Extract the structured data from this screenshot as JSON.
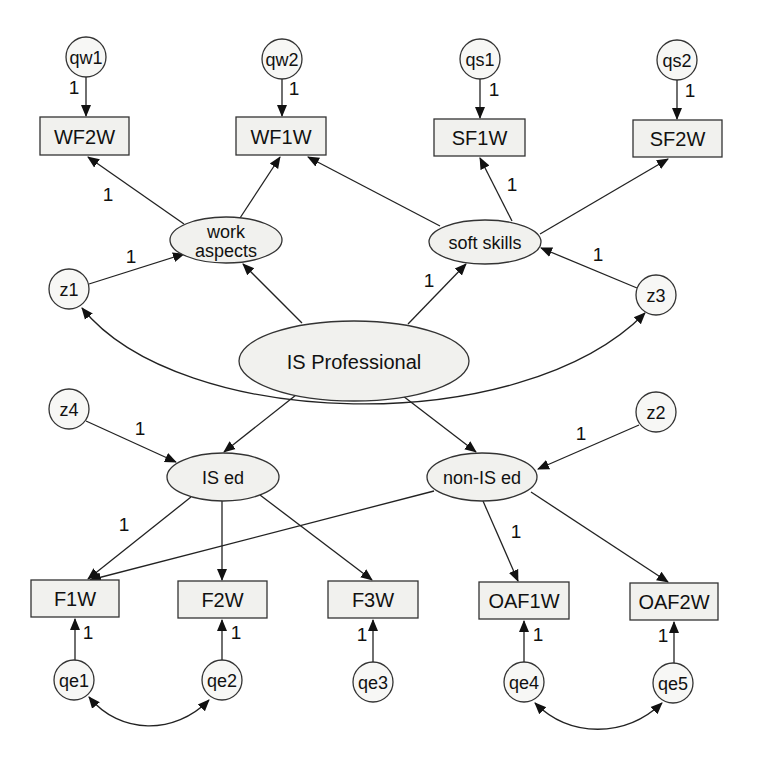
{
  "diagram": {
    "type": "structural-equation-model",
    "colors": {
      "node_fill": "#f1f1ee",
      "stroke": "#333333",
      "text": "#111111",
      "background": "#ffffff"
    },
    "latent_central": {
      "id": "is_professional",
      "label": "IS Professional"
    },
    "latent_factors": [
      {
        "id": "work_aspects",
        "label_line1": "work",
        "label_line2": "aspects"
      },
      {
        "id": "soft_skills",
        "label": "soft skills"
      },
      {
        "id": "is_ed",
        "label": "IS ed"
      },
      {
        "id": "non_is_ed",
        "label": "non-IS ed"
      }
    ],
    "observed_top": [
      {
        "id": "WF2W",
        "label": "WF2W",
        "error": "qw1",
        "error_weight": "1"
      },
      {
        "id": "WF1W",
        "label": "WF1W",
        "error": "qw2",
        "error_weight": "1"
      },
      {
        "id": "SF1W",
        "label": "SF1W",
        "error": "qs1",
        "error_weight": "1"
      },
      {
        "id": "SF2W",
        "label": "SF2W",
        "error": "qs2",
        "error_weight": "1"
      }
    ],
    "observed_bottom": [
      {
        "id": "F1W",
        "label": "F1W",
        "error": "qe1",
        "error_weight": "1"
      },
      {
        "id": "F2W",
        "label": "F2W",
        "error": "qe2",
        "error_weight": "1"
      },
      {
        "id": "F3W",
        "label": "F3W",
        "error": "qe3",
        "error_weight": "1"
      },
      {
        "id": "OAF1W",
        "label": "OAF1W",
        "error": "qe4",
        "error_weight": "1"
      },
      {
        "id": "OAF2W",
        "label": "OAF2W",
        "error": "qe5",
        "error_weight": "1"
      }
    ],
    "disturbances": [
      {
        "id": "z1",
        "label": "z1",
        "target": "work aspects",
        "weight": "1"
      },
      {
        "id": "z3",
        "label": "z3",
        "target": "soft skills",
        "weight": "1"
      },
      {
        "id": "z4",
        "label": "z4",
        "target": "IS ed",
        "weight": "1"
      },
      {
        "id": "z2",
        "label": "z2",
        "target": "non-IS ed",
        "weight": "1"
      }
    ],
    "path_weights": {
      "work_aspects_to_WF2W": "1",
      "soft_skills_to_SF1W": "1",
      "is_professional_to_soft_skills": "1",
      "is_ed_to_F1W": "1",
      "non_is_ed_to_OAF1W": "1"
    },
    "covariances": [
      {
        "from": "z1",
        "to": "z3"
      },
      {
        "from": "qe1",
        "to": "qe2"
      },
      {
        "from": "qe4",
        "to": "qe5"
      }
    ]
  }
}
